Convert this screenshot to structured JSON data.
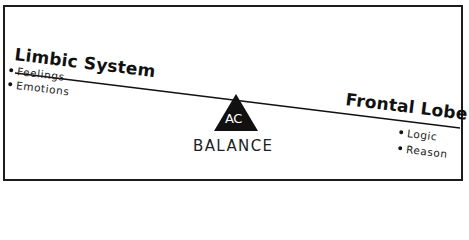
{
  "diagram": {
    "left": {
      "title": "Limbic System",
      "items": [
        "Feelings",
        "Emotions"
      ]
    },
    "right": {
      "title": "Frontal Lobe",
      "items": [
        "Logic",
        "Reason"
      ]
    },
    "fulcrum": {
      "logo_text": "AC",
      "label": "BALANCE"
    },
    "colors": {
      "ink": "#111111",
      "background": "#ffffff"
    }
  }
}
